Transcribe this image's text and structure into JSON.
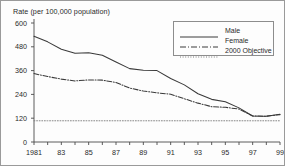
{
  "chart_data": {
    "type": "line",
    "title": "",
    "ylabel": "Rate (per 100,000 population)",
    "xlabel": "",
    "ylim": [
      0,
      600
    ],
    "xlim": [
      1981,
      1999
    ],
    "yticks": [
      0,
      120,
      240,
      360,
      480,
      600
    ],
    "ytick_labels": [
      "0",
      "120",
      "240",
      "360",
      "480",
      "600"
    ],
    "xticks": [
      1981,
      1982,
      1983,
      1984,
      1985,
      1986,
      1987,
      1988,
      1989,
      1990,
      1991,
      1992,
      1993,
      1994,
      1995,
      1996,
      1997,
      1998,
      1999
    ],
    "xtick_labels_shown": [
      "1981",
      "83",
      "85",
      "87",
      "89",
      "91",
      "93",
      "95",
      "97",
      "99"
    ],
    "xtick_label_years": [
      1981,
      1983,
      1985,
      1987,
      1989,
      1991,
      1993,
      1995,
      1997,
      1999
    ],
    "grid": false,
    "legend_position": "upper right",
    "x": [
      1981,
      1982,
      1983,
      1984,
      1985,
      1986,
      1987,
      1988,
      1989,
      1990,
      1991,
      1992,
      1993,
      1994,
      1995,
      1996,
      1997,
      1998,
      1999
    ],
    "series": [
      {
        "name": "Male",
        "style": "solid",
        "color": "#3a3a3a",
        "values": [
          533,
          505,
          468,
          447,
          450,
          437,
          403,
          370,
          362,
          360,
          320,
          288,
          243,
          215,
          203,
          172,
          131,
          130,
          140
        ]
      },
      {
        "name": "Female",
        "style": "dash-dot",
        "color": "#3a3a3a",
        "values": [
          345,
          330,
          317,
          308,
          313,
          312,
          300,
          272,
          257,
          248,
          241,
          218,
          196,
          178,
          175,
          166,
          131,
          130,
          138
        ]
      },
      {
        "name": "2000 Objective",
        "style": "dotted",
        "color": "#7c7c7c",
        "values": [
          107,
          107,
          107,
          107,
          107,
          107,
          107,
          107,
          107,
          107,
          107,
          107,
          107,
          107,
          107,
          107,
          107,
          107,
          107
        ]
      }
    ]
  },
  "legend": {
    "entries": [
      {
        "label": "Male"
      },
      {
        "label": "Female"
      },
      {
        "label": "2000 Objective"
      }
    ]
  },
  "axis_label": {
    "y": "Rate (per 100,000 population)"
  }
}
